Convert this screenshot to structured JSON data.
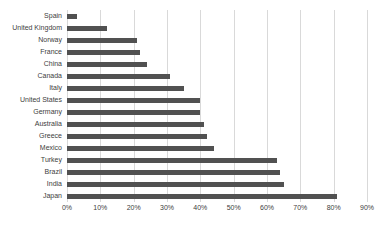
{
  "chart_data": {
    "type": "bar",
    "orientation": "horizontal",
    "title": "",
    "xlabel": "",
    "ylabel": "",
    "categories": [
      "Spain",
      "United Kingdom",
      "Norway",
      "France",
      "China",
      "Canada",
      "Italy",
      "United States",
      "Germany",
      "Australia",
      "Greece",
      "Mexico",
      "Turkey",
      "Brazil",
      "India",
      "Japan"
    ],
    "values": [
      3,
      12,
      21,
      22,
      24,
      31,
      35,
      40,
      40,
      41,
      42,
      44,
      63,
      64,
      65,
      81
    ],
    "value_unit": "%",
    "x_ticks": [
      "0%",
      "10%",
      "20%",
      "30%",
      "40%",
      "50%",
      "60%",
      "70%",
      "80%",
      "90%"
    ],
    "x_tick_values": [
      0,
      10,
      20,
      30,
      40,
      50,
      60,
      70,
      80,
      90
    ],
    "xlim": [
      0,
      90
    ],
    "grid": true,
    "legend": false,
    "colors": {
      "bar": "#515151",
      "gridline": "#d9d9d9",
      "label": "#404040",
      "background": "#ffffff"
    }
  }
}
